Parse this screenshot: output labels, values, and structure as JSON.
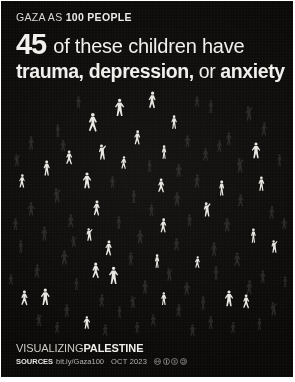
{
  "poster": {
    "background_color": "#0a0908",
    "figure_color": "#e9e7e2",
    "figure_dim_color": "#6e6a64"
  },
  "header": {
    "kicker_prefix": "GAZA AS ",
    "kicker_bold": "100 PEOPLE",
    "stat_number": "45",
    "headline_line1": " of these children have",
    "headline_line2_a": "trauma, depression,",
    "headline_line2_b": " or ",
    "headline_line2_c": "anxiety"
  },
  "footer": {
    "logo_light": "VISUALIZING",
    "logo_bold": "PALESTINE",
    "sources_label": "SOURCES",
    "sources_url": "bit.ly/Gaza100",
    "date": "OCT 2023",
    "license_icons": [
      "cc-icon",
      "cc-by-icon",
      "cc-nc-icon",
      "cc-sa-icon"
    ]
  },
  "chart_data": {
    "type": "pictogram",
    "title": "GAZA AS 100 PEOPLE",
    "subtitle": "45 of these children have trauma, depression, or anxiety",
    "unit": "1 figure = 1 person",
    "total": 100,
    "highlighted": 45,
    "dimmed": 55,
    "categories": [
      "children with trauma, depression, or anxiety",
      "other people in Gaza"
    ],
    "values": [
      45,
      55
    ],
    "legend": [],
    "figures": [
      {
        "x": 119,
        "y": 10,
        "h": 22,
        "pose": 3,
        "on": true
      },
      {
        "x": 151,
        "y": 3,
        "h": 21,
        "pose": 1,
        "on": true
      },
      {
        "x": 92,
        "y": 24,
        "h": 24,
        "pose": 5,
        "on": true
      },
      {
        "x": 173,
        "y": 27,
        "h": 17,
        "pose": 2,
        "on": true
      },
      {
        "x": 210,
        "y": 12,
        "h": 16,
        "pose": 0,
        "on": false
      },
      {
        "x": 247,
        "y": 18,
        "h": 18,
        "pose": 4,
        "on": false
      },
      {
        "x": 263,
        "y": 34,
        "h": 17,
        "pose": 1,
        "on": false
      },
      {
        "x": 57,
        "y": 36,
        "h": 16,
        "pose": 0,
        "on": false
      },
      {
        "x": 30,
        "y": 48,
        "h": 17,
        "pose": 2,
        "on": false
      },
      {
        "x": 136,
        "y": 42,
        "h": 18,
        "pose": 1,
        "on": true
      },
      {
        "x": 186,
        "y": 47,
        "h": 15,
        "pose": 3,
        "on": false
      },
      {
        "x": 228,
        "y": 44,
        "h": 16,
        "pose": 2,
        "on": false
      },
      {
        "x": 101,
        "y": 56,
        "h": 19,
        "pose": 4,
        "on": true
      },
      {
        "x": 163,
        "y": 57,
        "h": 17,
        "pose": 0,
        "on": true
      },
      {
        "x": 205,
        "y": 60,
        "h": 16,
        "pose": 5,
        "on": false
      },
      {
        "x": 255,
        "y": 54,
        "h": 20,
        "pose": 3,
        "on": true
      },
      {
        "x": 68,
        "y": 62,
        "h": 18,
        "pose": 5,
        "on": true
      },
      {
        "x": 46,
        "y": 72,
        "h": 19,
        "pose": 2,
        "on": true
      },
      {
        "x": 123,
        "y": 68,
        "h": 16,
        "pose": 1,
        "on": true
      },
      {
        "x": 148,
        "y": 72,
        "h": 15,
        "pose": 0,
        "on": false
      },
      {
        "x": 178,
        "y": 76,
        "h": 16,
        "pose": 3,
        "on": false
      },
      {
        "x": 238,
        "y": 70,
        "h": 18,
        "pose": 4,
        "on": false
      },
      {
        "x": 21,
        "y": 86,
        "h": 17,
        "pose": 1,
        "on": true
      },
      {
        "x": 86,
        "y": 84,
        "h": 20,
        "pose": 3,
        "on": true
      },
      {
        "x": 111,
        "y": 88,
        "h": 15,
        "pose": 2,
        "on": false
      },
      {
        "x": 160,
        "y": 90,
        "h": 18,
        "pose": 5,
        "on": true
      },
      {
        "x": 196,
        "y": 86,
        "h": 17,
        "pose": 1,
        "on": false
      },
      {
        "x": 221,
        "y": 92,
        "h": 19,
        "pose": 0,
        "on": true
      },
      {
        "x": 260,
        "y": 88,
        "h": 18,
        "pose": 2,
        "on": true
      },
      {
        "x": 55,
        "y": 100,
        "h": 18,
        "pose": 4,
        "on": false
      },
      {
        "x": 133,
        "y": 102,
        "h": 16,
        "pose": 0,
        "on": false
      },
      {
        "x": 176,
        "y": 104,
        "h": 17,
        "pose": 3,
        "on": false
      },
      {
        "x": 240,
        "y": 106,
        "h": 16,
        "pose": 5,
        "on": false
      },
      {
        "x": 30,
        "y": 114,
        "h": 17,
        "pose": 3,
        "on": false
      },
      {
        "x": 96,
        "y": 112,
        "h": 19,
        "pose": 1,
        "on": true
      },
      {
        "x": 150,
        "y": 116,
        "h": 15,
        "pose": 2,
        "on": false
      },
      {
        "x": 205,
        "y": 114,
        "h": 18,
        "pose": 4,
        "on": true
      },
      {
        "x": 271,
        "y": 118,
        "h": 16,
        "pose": 1,
        "on": false
      },
      {
        "x": 70,
        "y": 126,
        "h": 17,
        "pose": 5,
        "on": false
      },
      {
        "x": 118,
        "y": 128,
        "h": 16,
        "pose": 0,
        "on": false
      },
      {
        "x": 162,
        "y": 130,
        "h": 18,
        "pose": 1,
        "on": true
      },
      {
        "x": 188,
        "y": 126,
        "h": 15,
        "pose": 2,
        "on": false
      },
      {
        "x": 226,
        "y": 130,
        "h": 17,
        "pose": 3,
        "on": false
      },
      {
        "x": 43,
        "y": 138,
        "h": 18,
        "pose": 2,
        "on": false
      },
      {
        "x": 88,
        "y": 140,
        "h": 16,
        "pose": 4,
        "on": true
      },
      {
        "x": 139,
        "y": 142,
        "h": 17,
        "pose": 3,
        "on": false
      },
      {
        "x": 252,
        "y": 140,
        "h": 18,
        "pose": 0,
        "on": true
      },
      {
        "x": 20,
        "y": 152,
        "h": 16,
        "pose": 0,
        "on": false
      },
      {
        "x": 108,
        "y": 152,
        "h": 19,
        "pose": 1,
        "on": true
      },
      {
        "x": 176,
        "y": 150,
        "h": 16,
        "pose": 5,
        "on": false
      },
      {
        "x": 213,
        "y": 154,
        "h": 17,
        "pose": 2,
        "on": false
      },
      {
        "x": 273,
        "y": 152,
        "h": 16,
        "pose": 4,
        "on": true
      },
      {
        "x": 63,
        "y": 162,
        "h": 18,
        "pose": 3,
        "on": false
      },
      {
        "x": 130,
        "y": 164,
        "h": 16,
        "pose": 2,
        "on": false
      },
      {
        "x": 156,
        "y": 166,
        "h": 17,
        "pose": 0,
        "on": true
      },
      {
        "x": 196,
        "y": 168,
        "h": 15,
        "pose": 1,
        "on": true
      },
      {
        "x": 236,
        "y": 164,
        "h": 18,
        "pose": 5,
        "on": false
      },
      {
        "x": 36,
        "y": 176,
        "h": 17,
        "pose": 1,
        "on": false
      },
      {
        "x": 95,
        "y": 174,
        "h": 20,
        "pose": 5,
        "on": true
      },
      {
        "x": 113,
        "y": 178,
        "h": 22,
        "pose": 3,
        "on": true
      },
      {
        "x": 168,
        "y": 180,
        "h": 16,
        "pose": 4,
        "on": false
      },
      {
        "x": 215,
        "y": 178,
        "h": 17,
        "pose": 0,
        "on": false
      },
      {
        "x": 262,
        "y": 182,
        "h": 16,
        "pose": 2,
        "on": false
      },
      {
        "x": 75,
        "y": 190,
        "h": 15,
        "pose": 0,
        "on": false
      },
      {
        "x": 144,
        "y": 192,
        "h": 17,
        "pose": 2,
        "on": false
      },
      {
        "x": 186,
        "y": 194,
        "h": 16,
        "pose": 3,
        "on": false
      },
      {
        "x": 248,
        "y": 192,
        "h": 18,
        "pose": 1,
        "on": false
      },
      {
        "x": 24,
        "y": 202,
        "h": 19,
        "pose": 5,
        "on": true
      },
      {
        "x": 44,
        "y": 200,
        "h": 21,
        "pose": 3,
        "on": true
      },
      {
        "x": 101,
        "y": 206,
        "h": 16,
        "pose": 1,
        "on": false
      },
      {
        "x": 131,
        "y": 208,
        "h": 15,
        "pose": 4,
        "on": false
      },
      {
        "x": 163,
        "y": 204,
        "h": 16,
        "pose": 2,
        "on": true
      },
      {
        "x": 202,
        "y": 208,
        "h": 17,
        "pose": 0,
        "on": false
      },
      {
        "x": 228,
        "y": 202,
        "h": 20,
        "pose": 3,
        "on": true
      },
      {
        "x": 245,
        "y": 206,
        "h": 18,
        "pose": 5,
        "on": true
      },
      {
        "x": 66,
        "y": 216,
        "h": 16,
        "pose": 2,
        "on": false
      },
      {
        "x": 118,
        "y": 218,
        "h": 15,
        "pose": 0,
        "on": false
      },
      {
        "x": 178,
        "y": 216,
        "h": 16,
        "pose": 1,
        "on": false
      },
      {
        "x": 272,
        "y": 214,
        "h": 17,
        "pose": 4,
        "on": false
      },
      {
        "x": 37,
        "y": 226,
        "h": 15,
        "pose": 4,
        "on": false
      },
      {
        "x": 86,
        "y": 228,
        "h": 16,
        "pose": 3,
        "on": true
      },
      {
        "x": 152,
        "y": 226,
        "h": 15,
        "pose": 5,
        "on": false
      },
      {
        "x": 210,
        "y": 228,
        "h": 16,
        "pose": 2,
        "on": false
      },
      {
        "x": 258,
        "y": 230,
        "h": 15,
        "pose": 0,
        "on": false
      },
      {
        "x": 56,
        "y": 234,
        "h": 14,
        "pose": 1,
        "on": false
      },
      {
        "x": 104,
        "y": 236,
        "h": 15,
        "pose": 5,
        "on": false
      },
      {
        "x": 136,
        "y": 234,
        "h": 14,
        "pose": 2,
        "on": false
      },
      {
        "x": 191,
        "y": 236,
        "h": 15,
        "pose": 3,
        "on": false
      },
      {
        "x": 232,
        "y": 234,
        "h": 14,
        "pose": 1,
        "on": false
      },
      {
        "x": 15,
        "y": 66,
        "h": 15,
        "pose": 4,
        "on": false
      },
      {
        "x": 278,
        "y": 66,
        "h": 15,
        "pose": 0,
        "on": false
      },
      {
        "x": 77,
        "y": 8,
        "h": 15,
        "pose": 2,
        "on": false
      },
      {
        "x": 196,
        "y": 8,
        "h": 14,
        "pose": 5,
        "on": false
      },
      {
        "x": 14,
        "y": 130,
        "h": 15,
        "pose": 2,
        "on": false
      },
      {
        "x": 283,
        "y": 130,
        "h": 14,
        "pose": 3,
        "on": false
      },
      {
        "x": 62,
        "y": 52,
        "h": 14,
        "pose": 3,
        "on": false
      },
      {
        "x": 218,
        "y": 52,
        "h": 15,
        "pose": 1,
        "on": false
      },
      {
        "x": 10,
        "y": 186,
        "h": 14,
        "pose": 5,
        "on": false
      },
      {
        "x": 284,
        "y": 188,
        "h": 14,
        "pose": 0,
        "on": false
      },
      {
        "x": 72,
        "y": 148,
        "h": 14,
        "pose": 4,
        "on": false
      }
    ]
  }
}
